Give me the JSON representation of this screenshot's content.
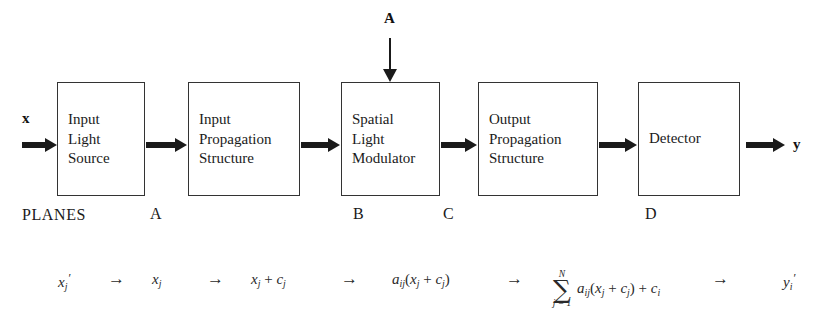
{
  "figure": {
    "background_color": "#ffffff",
    "line_color": "#1a1a1a"
  },
  "inputs": {
    "signal_vector": "x",
    "matrix_vector": "A"
  },
  "outputs": {
    "result_vector": "y"
  },
  "blocks": [
    {
      "id": "input-light-source",
      "label": "Input\nLight\nSource"
    },
    {
      "id": "input-propagation",
      "label": "Input\nPropagation\nStructure"
    },
    {
      "id": "spatial-light-modulator",
      "label": "Spatial\nLight\nModulator"
    },
    {
      "id": "output-propagation",
      "label": "Output\nPropagation\nStructure"
    },
    {
      "id": "detector",
      "label": "Detector"
    }
  ],
  "planes": {
    "title": "PLANES",
    "letters": [
      "A",
      "B",
      "C",
      "D"
    ]
  },
  "equation": {
    "arrow_glyph": "→",
    "terms": {
      "t1_base": "x",
      "t1_sub": "j",
      "t2_base": "x",
      "t2_sub": "j",
      "t3_base": "x",
      "t3_sub": "j",
      "t3_plus": " + ",
      "t3_c": "c",
      "t3_csub": "j",
      "t4_a": "a",
      "t4_asub": "ij",
      "t4_open": "(",
      "t4_x": "x",
      "t4_xsub": "j",
      "t4_plus": " + ",
      "t4_c": "c",
      "t4_csub": "j",
      "t4_close": ")",
      "t5_sum_top": "N",
      "t5_sum_sigma": "∑",
      "t5_sum_bot": "j = 1",
      "t5_a": "a",
      "t5_asub": "ij",
      "t5_open": "(",
      "t5_x": "x",
      "t5_xsub": "j",
      "t5_plus": " + ",
      "t5_c": "c",
      "t5_csub": "j",
      "t5_close": ")",
      "t5_plus2": " + ",
      "t5_ci": "c",
      "t5_cisub": "i",
      "t6_base": "y",
      "t6_sub": "i"
    }
  }
}
